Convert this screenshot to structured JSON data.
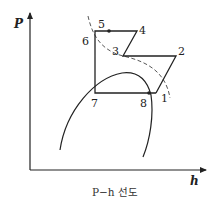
{
  "diagram": {
    "type": "P-h diagram (refrigeration cycle)",
    "axes": {
      "y_label": "P",
      "x_label": "h"
    },
    "caption": "P−h 선도",
    "points": [
      {
        "id": "1",
        "label": "1"
      },
      {
        "id": "2",
        "label": "2"
      },
      {
        "id": "3",
        "label": "3"
      },
      {
        "id": "4",
        "label": "4"
      },
      {
        "id": "5",
        "label": "5"
      },
      {
        "id": "6",
        "label": "6"
      },
      {
        "id": "7",
        "label": "7"
      },
      {
        "id": "8",
        "label": "8"
      }
    ],
    "cycle_path": "1-2-3-4-5-6-7-8-1",
    "curves": [
      "saturation dome (solid)",
      "dashed curve through 5, 3, 1"
    ],
    "colors": {
      "line": "#222222",
      "background": "#ffffff"
    }
  }
}
